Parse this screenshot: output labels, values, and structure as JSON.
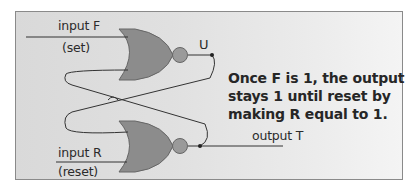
{
  "diagram": {
    "labels": {
      "input_f": "input F",
      "set": "(set)",
      "output_u": "U",
      "input_r": "input R",
      "reset": "(reset)",
      "output_t": "output T"
    },
    "note_lines": [
      "Once F is 1, the output",
      "stays 1 until reset by",
      "making R equal to 1."
    ],
    "colors": {
      "gate_fill": "#8c8c8c",
      "gate_stroke": "#555555",
      "wire": "#333333",
      "panel_border": "#8a8a8a"
    },
    "gates": [
      {
        "name": "nor-gate-top",
        "inputs": [
          "input F",
          "feedback from T"
        ],
        "output": "U"
      },
      {
        "name": "nor-gate-bottom",
        "inputs": [
          "feedback from U",
          "input R"
        ],
        "output": "output T"
      }
    ]
  }
}
